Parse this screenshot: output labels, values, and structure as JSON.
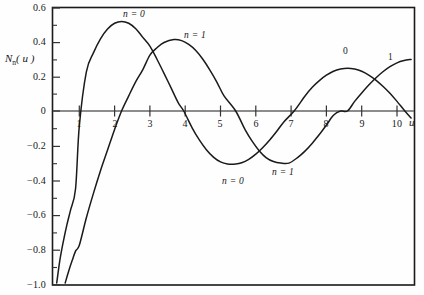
{
  "figure": {
    "background_color": "#fefefe",
    "frame_color": "#1a1a1a",
    "curve_color": "#1a1a1a",
    "axis_color": "#555555"
  },
  "axes": {
    "y_label_main": "N",
    "y_label_sub": "n",
    "y_label_arg": "( u )",
    "x_label": "u"
  },
  "ticks": {
    "y": [
      "0.6",
      "0.4",
      "0.2",
      "0",
      "−0.2",
      "−0.4",
      "−0.6",
      "−0.8",
      "−1.0"
    ],
    "x": [
      "1",
      "2",
      "3",
      "4",
      "5",
      "6",
      "7",
      "8",
      "9",
      "10"
    ]
  },
  "annotations": {
    "n0_first_peak": "n = 0",
    "n1_first_peak": "n = 1",
    "n0_trough": "n = 0",
    "n1_trough": "n = 1",
    "n0_second_peak": "0",
    "n1_second_peak": "1"
  },
  "chart_data": {
    "type": "line",
    "title": "",
    "xlabel": "u",
    "ylabel": "N_n(u)",
    "xlim": [
      0,
      10.8
    ],
    "ylim": [
      -1.0,
      0.6
    ],
    "grid": false,
    "legend": "inline-annotations",
    "xticks": [
      1,
      2,
      3,
      4,
      5,
      6,
      7,
      8,
      9,
      10
    ],
    "yticks": [
      0.6,
      0.4,
      0.2,
      0,
      -0.2,
      -0.4,
      -0.6,
      -0.8,
      -1.0
    ],
    "y_minor_tick_step": 0.1,
    "series": [
      {
        "name": "N_0(u)",
        "label": "n = 0",
        "zero_crossings": [
          0.894,
          3.958,
          7.086,
          10.222
        ],
        "extrema": [
          {
            "u": 2.2,
            "value": 0.521
          },
          {
            "u": 5.43,
            "value": -0.308
          },
          {
            "u": 8.6,
            "value": 0.249
          }
        ],
        "x": [
          0.36,
          0.45,
          0.55,
          0.65,
          0.75,
          0.894,
          1.0,
          1.2,
          1.4,
          1.6,
          1.8,
          2.0,
          2.2,
          2.4,
          2.6,
          2.8,
          3.0,
          3.2,
          3.4,
          3.6,
          3.8,
          3.958,
          4.2,
          4.4,
          4.6,
          4.8,
          5.0,
          5.2,
          5.43,
          5.6,
          5.8,
          6.0,
          6.2,
          6.4,
          6.6,
          6.8,
          7.086,
          7.4,
          7.6,
          7.8,
          8.0,
          8.2,
          8.4,
          8.6,
          8.8,
          9.0,
          9.2,
          9.4,
          9.6,
          9.8,
          10.0,
          10.222,
          10.4
        ],
        "y": [
          -1.0,
          -0.867,
          -0.756,
          -0.661,
          -0.578,
          -0.452,
          -0.088,
          0.228,
          0.338,
          0.42,
          0.477,
          0.51,
          0.521,
          0.51,
          0.478,
          0.428,
          0.377,
          0.301,
          0.219,
          0.134,
          0.049,
          0.0,
          -0.099,
          -0.168,
          -0.225,
          -0.268,
          -0.296,
          -0.308,
          -0.308,
          -0.301,
          -0.281,
          -0.251,
          -0.212,
          -0.167,
          -0.116,
          -0.062,
          0.0,
          0.089,
          0.138,
          0.177,
          0.208,
          0.231,
          0.244,
          0.249,
          0.244,
          0.231,
          0.209,
          0.18,
          0.144,
          0.103,
          0.056,
          0.0,
          -0.041
        ]
      },
      {
        "name": "N_1(u)",
        "label": "n = 1",
        "zero_crossings": [
          2.197,
          5.43,
          8.596
        ],
        "extrema": [
          {
            "u": 3.68,
            "value": 0.415
          },
          {
            "u": 6.94,
            "value": -0.303
          }
        ],
        "x": [
          0.6,
          0.7,
          0.8,
          0.9,
          1.0,
          1.2,
          1.4,
          1.6,
          1.8,
          2.0,
          2.197,
          2.4,
          2.6,
          2.8,
          3.0,
          3.2,
          3.4,
          3.68,
          3.9,
          4.1,
          4.3,
          4.5,
          4.7,
          4.9,
          5.1,
          5.43,
          5.7,
          5.9,
          6.1,
          6.3,
          6.5,
          6.7,
          6.94,
          7.2,
          7.4,
          7.6,
          7.8,
          8.0,
          8.2,
          8.4,
          8.596,
          8.8,
          9.0,
          9.2,
          9.4,
          9.6,
          9.8,
          10.0,
          10.2,
          10.4
        ],
        "y": [
          -1.0,
          -0.93,
          -0.868,
          -0.812,
          -0.781,
          -0.621,
          -0.479,
          -0.347,
          -0.227,
          -0.107,
          0.0,
          0.088,
          0.171,
          0.241,
          0.325,
          0.368,
          0.398,
          0.415,
          0.409,
          0.387,
          0.352,
          0.301,
          0.238,
          0.167,
          0.088,
          0.0,
          -0.11,
          -0.177,
          -0.232,
          -0.272,
          -0.294,
          -0.303,
          -0.303,
          -0.268,
          -0.232,
          -0.187,
          -0.137,
          -0.082,
          -0.025,
          0.0,
          0.0,
          0.056,
          0.105,
          0.151,
          0.192,
          0.228,
          0.258,
          0.28,
          0.293,
          0.3
        ]
      }
    ]
  }
}
